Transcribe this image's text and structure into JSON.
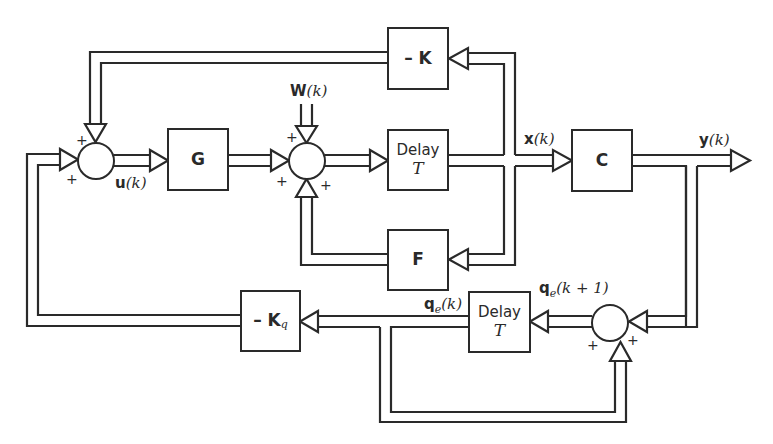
{
  "diagram": {
    "blocks": {
      "G": {
        "label": "G"
      },
      "neg_K": {
        "label": "– K"
      },
      "delay1": {
        "line1": "Delay",
        "line2": "T"
      },
      "F": {
        "label": "F"
      },
      "C": {
        "label": "C"
      },
      "delay2": {
        "line1": "Delay",
        "line2": "T"
      },
      "neg_Kq": {
        "label": "– K",
        "subscript": "q"
      }
    },
    "signals": {
      "u": {
        "bold": "u",
        "arg": "(k)"
      },
      "W": {
        "bold": "W",
        "arg": "(k)"
      },
      "x": {
        "bold": "x",
        "arg": "(k)"
      },
      "y": {
        "bold": "y",
        "arg": "(k)"
      },
      "qe_k": {
        "bold": "q",
        "sub": "e",
        "arg": "(k)"
      },
      "qe_k1": {
        "bold": "q",
        "sub": "e",
        "arg": "(k + 1)"
      }
    },
    "summing_junctions": [
      {
        "id": "sum1",
        "signs": [
          "+",
          "+"
        ]
      },
      {
        "id": "sum2",
        "signs": [
          "+",
          "+",
          "+"
        ]
      },
      {
        "id": "sum3",
        "signs": [
          "+",
          "+"
        ]
      }
    ],
    "colors": {
      "line": "#2a2a2a",
      "background": "#ffffff"
    }
  }
}
